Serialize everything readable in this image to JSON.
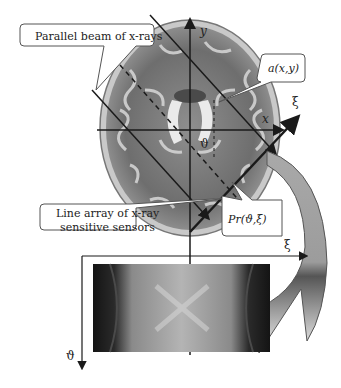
{
  "diagram": {
    "callouts": {
      "beam": "Parallel beam of x-rays",
      "object": "a(x,y)",
      "sensors_line1": "Line array of x-ray",
      "sensors_line2": "sensitive sensors",
      "projection": "Pr(ϑ,ξ)"
    },
    "axes": {
      "x": "x",
      "y": "y",
      "xi_rotated": "ξ",
      "angle": "ϑ",
      "sinogram_xi": "ξ",
      "sinogram_theta": "ϑ"
    },
    "colors": {
      "line": "#1a1a1a",
      "callout_border": "#555555",
      "arrow_fill_top": "#a9a9a9",
      "arrow_fill_bottom": "#f2f2f2",
      "sinogram_dark": "#151515",
      "sinogram_light": "#bdbdbd"
    }
  }
}
